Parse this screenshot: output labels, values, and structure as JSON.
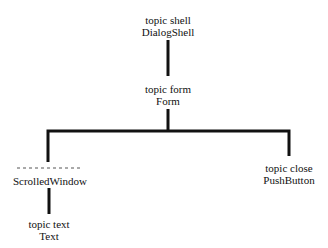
{
  "diagram": {
    "type": "widget-hierarchy-tree",
    "line_color": "#111111",
    "nodes": [
      {
        "id": "shell",
        "name_label": "topic shell",
        "class_label": "DialogShell"
      },
      {
        "id": "form",
        "name_label": "topic form",
        "class_label": "Form"
      },
      {
        "id": "scrolled",
        "name_label": "- - - - - - - - - -",
        "class_label": "ScrolledWindow"
      },
      {
        "id": "close",
        "name_label": "topic close",
        "class_label": "PushButton"
      },
      {
        "id": "text",
        "name_label": "topic text",
        "class_label": "Text"
      }
    ],
    "edges": [
      {
        "from": "shell",
        "to": "form"
      },
      {
        "from": "form",
        "to": "scrolled"
      },
      {
        "from": "form",
        "to": "close"
      },
      {
        "from": "scrolled",
        "to": "text"
      }
    ]
  }
}
